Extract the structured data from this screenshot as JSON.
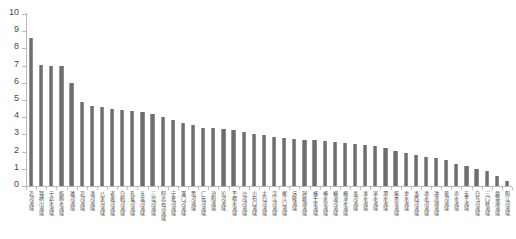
{
  "chart_data": {
    "type": "bar",
    "title": "",
    "subtitle": "",
    "xlabel": "",
    "ylabel": "",
    "ylim": [
      0,
      10
    ],
    "ytick_labels": [
      "10",
      "9",
      "8",
      "7",
      "6",
      "5",
      "4",
      "3",
      "2",
      "1",
      "0"
    ],
    "ytick_values": [
      10,
      9,
      8,
      7,
      6,
      5,
      4,
      3,
      2,
      1,
      0
    ],
    "grid": false,
    "legend": null,
    "legend_position": "none",
    "bar_color": "#6e6e6e",
    "axis_color": "#b9b9b9",
    "categories": [
      "沂河流域",
      "锦绣川流域",
      "宁武水流域",
      "临朐水流域",
      "潍河流域",
      "沂河流域",
      "洮河流域",
      "八里沟流域",
      "老黄河流域",
      "白鹤河流域",
      "孔雀河流域",
      "五龙河流域",
      "三岔河流域",
      "阿克苏河流域",
      "宁夏河流域",
      "瀑门河流域",
      "黑河流域",
      "广元河流域",
      "汾阳流域",
      "沁河流域",
      "平都水流域",
      "沙河河流域",
      "小石口流域",
      "太白河流域",
      "汉江河流域",
      "岷江口流域",
      "沅陵流域",
      "洞庭湖流域",
      "横千里流域",
      "横水草流域",
      "横漳河流域",
      "横漳水流域",
      "洛河流域",
      "淮水流域",
      "泉水流域",
      "渭水流域",
      "柴木草流域",
      "金水流域",
      "洛西河流域",
      "清水河流域",
      "洪泽湖流域",
      "黄河流域",
      "赤水流域",
      "安平流域",
      "白马河流域",
      "三门峡流域",
      "盘锦渤流域",
      "阳江河流域"
    ],
    "values": [
      8.6,
      7.05,
      7.0,
      6.95,
      6.0,
      4.9,
      4.65,
      4.6,
      4.45,
      4.4,
      4.35,
      4.3,
      4.2,
      4.0,
      3.85,
      3.65,
      3.55,
      3.4,
      3.35,
      3.3,
      3.25,
      3.15,
      3.05,
      2.95,
      2.85,
      2.8,
      2.75,
      2.7,
      2.65,
      2.6,
      2.55,
      2.5,
      2.45,
      2.4,
      2.3,
      2.2,
      2.05,
      1.9,
      1.8,
      1.7,
      1.6,
      1.5,
      1.3,
      1.15,
      1.0,
      0.85,
      0.6,
      0.3
    ]
  }
}
